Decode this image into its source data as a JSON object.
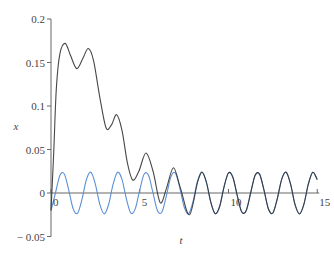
{
  "chart_data": {
    "type": "line",
    "title": "",
    "xlabel": "t",
    "ylabel": "x",
    "xlim": [
      0,
      15
    ],
    "ylim": [
      -0.05,
      0.2
    ],
    "grid": false,
    "legend": null,
    "x_ticks": [
      0,
      5,
      10,
      15
    ],
    "x_tick_labels": [
      "0",
      "5",
      "10",
      "15"
    ],
    "y_ticks": [
      -0.05,
      0,
      0.05,
      0.1,
      0.15,
      0.2
    ],
    "y_tick_labels": [
      "− 0.05",
      "0",
      "0.05",
      "0.1",
      "0.15",
      "0.2"
    ],
    "series": [
      {
        "name": "steady-state solution",
        "color": "#5b8fd6",
        "description": "x = 0.024 sin(4t - 1.0)",
        "t": [
          0,
          0.25,
          0.5,
          0.75,
          1,
          1.25,
          1.5,
          1.75,
          2,
          2.25,
          2.5,
          2.75,
          3,
          3.25,
          3.5,
          3.75,
          4,
          4.25,
          4.5,
          4.75,
          5,
          5.25,
          5.5,
          5.75,
          6,
          6.25,
          6.5,
          6.75,
          7,
          7.25,
          7.5,
          7.75,
          8,
          8.25,
          8.5,
          8.75,
          9,
          9.25,
          9.5,
          9.75,
          10,
          10.25,
          10.5,
          10.75,
          11,
          11.25,
          11.5,
          11.75,
          12,
          12.25,
          12.5,
          12.75,
          13,
          13.25,
          13.5,
          13.75,
          14,
          14.25,
          14.5,
          14.75,
          15
        ],
        "x": [
          -0.0202,
          0.0,
          0.0202,
          0.0218,
          0.0034,
          -0.0182,
          -0.0231,
          -0.0068,
          0.0158,
          0.0238,
          0.01,
          -0.0131,
          -0.024,
          -0.0129,
          0.0102,
          0.0238,
          0.0156,
          -0.007,
          -0.0231,
          -0.018,
          0.0036,
          0.0218,
          0.0201,
          -0.0002,
          -0.0203,
          -0.0218,
          -0.0033,
          0.0183,
          0.0231,
          0.0066,
          -0.0159,
          -0.0238,
          -0.0099,
          0.0132,
          0.024,
          0.0128,
          -0.0103,
          -0.0238,
          -0.0155,
          0.0071,
          0.0231,
          0.0179,
          -0.0037,
          -0.0219,
          -0.02,
          0.0003,
          0.0203,
          0.0217,
          0.0032,
          -0.0184,
          -0.023,
          -0.0065,
          0.016,
          0.0238,
          0.0098,
          -0.0133,
          -0.024,
          -0.0127,
          0.0104,
          0.0238,
          0.0154
        ]
      },
      {
        "name": "full solution",
        "color": "#333333",
        "t": [
          0,
          0.15,
          0.3,
          0.5,
          0.8,
          1.1,
          1.45,
          1.8,
          2.1,
          2.4,
          2.75,
          3.1,
          3.4,
          3.7,
          4.0,
          4.3,
          4.6,
          4.95,
          5.35,
          5.75,
          6.15,
          6.5,
          6.9,
          7.3,
          7.8,
          8.25,
          8.5,
          8.75,
          9,
          9.25,
          9.5,
          9.75,
          10,
          10.25,
          10.5,
          10.75,
          11,
          11.25,
          11.5,
          11.75,
          12,
          12.25,
          12.5,
          12.75,
          13,
          13.25,
          13.5,
          13.75,
          14,
          14.25,
          14.5,
          14.75,
          15
        ],
        "x": [
          -0.02,
          0.045,
          0.12,
          0.16,
          0.172,
          0.158,
          0.143,
          0.155,
          0.166,
          0.152,
          0.11,
          0.075,
          0.078,
          0.09,
          0.072,
          0.035,
          0.015,
          0.025,
          0.046,
          0.025,
          -0.011,
          0.005,
          0.029,
          0.005,
          -0.025,
          0.012,
          0.024,
          0.0128,
          -0.0103,
          -0.0238,
          -0.0155,
          0.0071,
          0.0231,
          0.0179,
          -0.0037,
          -0.0219,
          -0.02,
          0.0003,
          0.0203,
          0.0217,
          0.0032,
          -0.0184,
          -0.023,
          -0.0065,
          0.016,
          0.0238,
          0.0098,
          -0.0133,
          -0.024,
          -0.0127,
          0.0104,
          0.0238,
          0.0154
        ]
      }
    ],
    "axis_color": "#666666",
    "overlap_color": "#23305a"
  }
}
